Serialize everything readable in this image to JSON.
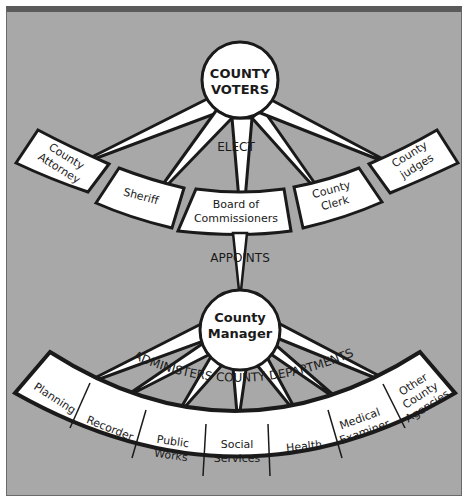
{
  "diagram": {
    "top_hub": {
      "line1": "COUNTY",
      "line2": "VOTERS"
    },
    "elect_label": "ELECT",
    "elected_offices": [
      {
        "lines": [
          "County",
          "Attorney"
        ]
      },
      {
        "lines": [
          "Sheriff"
        ]
      },
      {
        "lines": [
          "Board of",
          "Commissioners"
        ]
      },
      {
        "lines": [
          "County",
          "Clerk"
        ]
      },
      {
        "lines": [
          "County",
          "judges"
        ]
      }
    ],
    "appoints_label": "APPOINTS",
    "bottom_hub": {
      "line1": "County",
      "line2": "Manager"
    },
    "administers_label": "ADMINISTERS COUNTY DEPARTMENTS",
    "departments": [
      {
        "lines": [
          "Planning"
        ]
      },
      {
        "lines": [
          "Recorder"
        ]
      },
      {
        "lines": [
          "Public",
          "Works"
        ]
      },
      {
        "lines": [
          "Social",
          "Services"
        ]
      },
      {
        "lines": [
          "Health"
        ]
      },
      {
        "lines": [
          "Medical",
          "Examiner"
        ]
      },
      {
        "lines": [
          "Other",
          "County",
          "Agencies"
        ]
      }
    ],
    "colors": {
      "panel": "#a8a8a8",
      "box_fill": "#ffffff",
      "stroke": "#1a1a1a",
      "top_band": "#5a5a5a"
    }
  }
}
